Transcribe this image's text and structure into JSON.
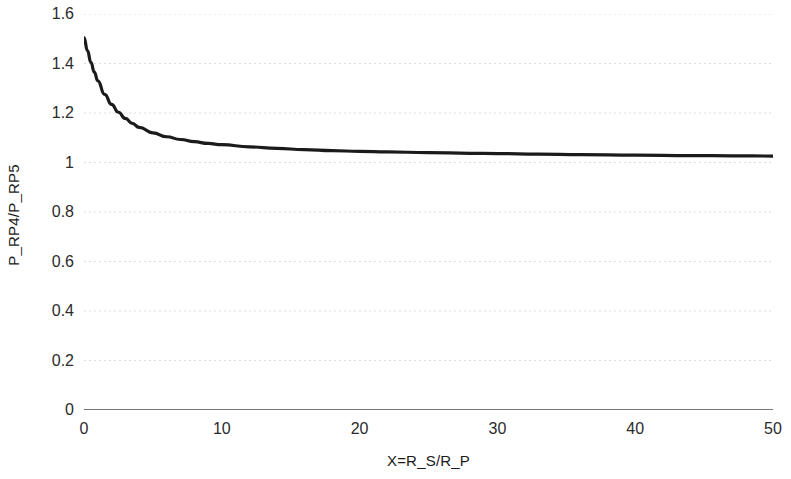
{
  "chart_data": {
    "type": "line",
    "title": "",
    "xlabel": "X=R_S/R_P",
    "ylabel": "P_RP4/P_RP5",
    "xlim": [
      0,
      50
    ],
    "ylim": [
      0,
      1.6
    ],
    "xticks": [
      0,
      10,
      20,
      30,
      40,
      50
    ],
    "xtick_labels": [
      "0",
      "10",
      "20",
      "30",
      "40",
      "50"
    ],
    "yticks": [
      0,
      0.2,
      0.4,
      0.6,
      0.8,
      1,
      1.2,
      1.4,
      1.6
    ],
    "ytick_labels": [
      "0",
      "0.2",
      "0.4",
      "0.6",
      "0.8",
      "1",
      "1.2",
      "1.4",
      "1.6"
    ],
    "grid": "horizontal",
    "legend": null,
    "line_color": "#1b1b1b",
    "axis_color": "#4a4a4a",
    "grid_color": "#dcdcdc",
    "series": [
      {
        "name": "P_RP4/P_RP5",
        "x": [
          0,
          0.25,
          0.5,
          0.75,
          1,
          1.5,
          2,
          2.5,
          3,
          3.5,
          4,
          5,
          6,
          7,
          8,
          9,
          10,
          12,
          14,
          16,
          18,
          20,
          22,
          25,
          28,
          30,
          33,
          36,
          40,
          44,
          47,
          50
        ],
        "y": [
          1.505,
          1.452,
          1.405,
          1.365,
          1.33,
          1.275,
          1.235,
          1.203,
          1.178,
          1.158,
          1.142,
          1.12,
          1.104,
          1.093,
          1.084,
          1.077,
          1.072,
          1.063,
          1.057,
          1.052,
          1.048,
          1.045,
          1.043,
          1.04,
          1.037,
          1.036,
          1.034,
          1.032,
          1.03,
          1.028,
          1.027,
          1.026
        ]
      }
    ]
  }
}
